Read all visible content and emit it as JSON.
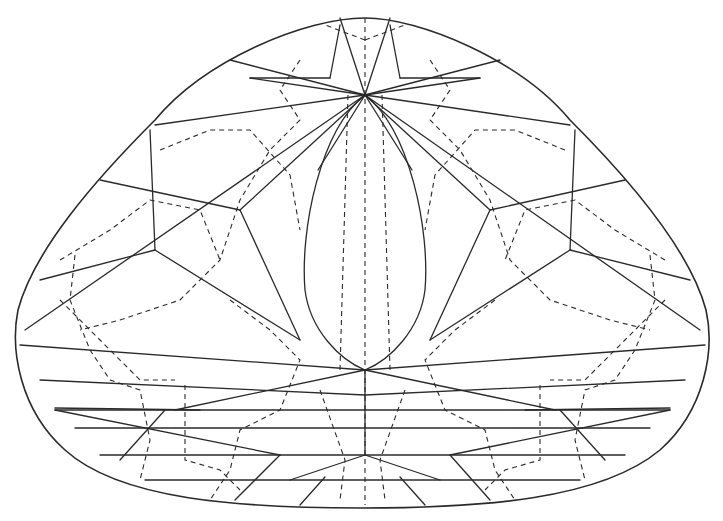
{
  "diagram": {
    "title": "",
    "line_color": "#2a2a2a",
    "background": "#ffffff",
    "legend": {
      "solid_lines": "visible facet edges (crown)",
      "dashed_lines": "hidden facet edges (pavilion)"
    },
    "labels": []
  }
}
